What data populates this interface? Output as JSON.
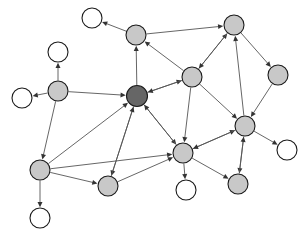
{
  "figure": {
    "type": "node-link-diagram",
    "background_color": "#ffffff",
    "width": 307,
    "height": 239
  },
  "style": {
    "hub_color": "#666666",
    "gray_color": "#c8c8c8",
    "white_color": "#ffffff",
    "node_stroke": "#1a1a1a",
    "edge_color": "#555555",
    "arrow_color": "#333333",
    "node_radius_gray": 10,
    "node_radius_white": 10,
    "node_radius_hub": 10.5
  },
  "chart_data": {
    "type": "scatter",
    "xlabel": "",
    "ylabel": "",
    "grid": false,
    "legend": "none",
    "xlim": [
      0,
      307
    ],
    "ylim": [
      0,
      239
    ],
    "node_count": 18,
    "edge_count": 33,
    "node_classes": [
      {
        "name": "hub",
        "color": "#666666",
        "count": 1
      },
      {
        "name": "intermediate",
        "color": "#c8c8c8",
        "count": 10
      },
      {
        "name": "leaf",
        "color": "#ffffff",
        "count": 7
      }
    ],
    "nodes": [
      {
        "id": "n0",
        "label": "",
        "x": 92,
        "y": 18,
        "r": 10,
        "class": "leaf",
        "color": "#ffffff"
      },
      {
        "id": "n1",
        "label": "",
        "x": 136,
        "y": 35,
        "r": 10,
        "class": "intermediate",
        "color": "#c8c8c8"
      },
      {
        "id": "n2",
        "label": "",
        "x": 234,
        "y": 25,
        "r": 10,
        "class": "intermediate",
        "color": "#c8c8c8"
      },
      {
        "id": "n3",
        "label": "",
        "x": 58,
        "y": 52,
        "r": 10,
        "class": "leaf",
        "color": "#ffffff"
      },
      {
        "id": "n4",
        "label": "",
        "x": 192,
        "y": 77,
        "r": 10,
        "class": "intermediate",
        "color": "#c8c8c8"
      },
      {
        "id": "n5",
        "label": "",
        "x": 278,
        "y": 75,
        "r": 10,
        "class": "intermediate",
        "color": "#c8c8c8"
      },
      {
        "id": "n6",
        "label": "",
        "x": 58,
        "y": 91,
        "r": 10,
        "class": "intermediate",
        "color": "#c8c8c8"
      },
      {
        "id": "n7",
        "label": "",
        "x": 137,
        "y": 96,
        "r": 10.5,
        "class": "hub",
        "color": "#666666"
      },
      {
        "id": "n8",
        "label": "",
        "x": 22,
        "y": 98,
        "r": 10,
        "class": "leaf",
        "color": "#ffffff"
      },
      {
        "id": "n9",
        "label": "",
        "x": 245,
        "y": 126,
        "r": 10,
        "class": "intermediate",
        "color": "#c8c8c8"
      },
      {
        "id": "n10",
        "label": "",
        "x": 183,
        "y": 153,
        "r": 10,
        "class": "intermediate",
        "color": "#c8c8c8"
      },
      {
        "id": "n11",
        "label": "",
        "x": 287,
        "y": 150,
        "r": 10,
        "class": "leaf",
        "color": "#ffffff"
      },
      {
        "id": "n12",
        "label": "",
        "x": 40,
        "y": 170,
        "r": 10,
        "class": "intermediate",
        "color": "#c8c8c8"
      },
      {
        "id": "n13",
        "label": "",
        "x": 238,
        "y": 184,
        "r": 10,
        "class": "intermediate",
        "color": "#c8c8c8"
      },
      {
        "id": "n14",
        "label": "",
        "x": 108,
        "y": 186,
        "r": 10,
        "class": "intermediate",
        "color": "#c8c8c8"
      },
      {
        "id": "n15",
        "label": "",
        "x": 186,
        "y": 190,
        "r": 10,
        "class": "leaf",
        "color": "#ffffff"
      },
      {
        "id": "n16",
        "label": "",
        "x": 40,
        "y": 218,
        "r": 10,
        "class": "leaf",
        "color": "#ffffff"
      },
      {
        "id": "n17",
        "label": "",
        "x": 234,
        "y": 25,
        "r": 0,
        "class": "hidden",
        "color": "#ffffff"
      }
    ],
    "edges": [
      {
        "from": "n1",
        "to": "n0",
        "directed": true
      },
      {
        "from": "n1",
        "to": "n2",
        "directed": true
      },
      {
        "from": "n7",
        "to": "n1",
        "directed": true
      },
      {
        "from": "n4",
        "to": "n1",
        "directed": true
      },
      {
        "from": "n4",
        "to": "n2",
        "directed": true
      },
      {
        "from": "n2",
        "to": "n5",
        "directed": true
      },
      {
        "from": "n9",
        "to": "n2",
        "directed": true
      },
      {
        "from": "n6",
        "to": "n3",
        "directed": true
      },
      {
        "from": "n6",
        "to": "n8",
        "directed": true
      },
      {
        "from": "n6",
        "to": "n7",
        "directed": true
      },
      {
        "from": "n6",
        "to": "n12",
        "directed": true
      },
      {
        "from": "n7",
        "to": "n4",
        "directed": true
      },
      {
        "from": "n4",
        "to": "n9",
        "directed": true
      },
      {
        "from": "n4",
        "to": "n10",
        "directed": true
      },
      {
        "from": "n5",
        "to": "n9",
        "directed": true
      },
      {
        "from": "n7",
        "to": "n10",
        "directed": true
      },
      {
        "from": "n7",
        "to": "n14",
        "directed": true
      },
      {
        "from": "n12",
        "to": "n7",
        "directed": true
      },
      {
        "from": "n14",
        "to": "n7",
        "directed": true
      },
      {
        "from": "n10",
        "to": "n7",
        "directed": true
      },
      {
        "from": "n9",
        "to": "n11",
        "directed": true
      },
      {
        "from": "n9",
        "to": "n13",
        "directed": true
      },
      {
        "from": "n10",
        "to": "n9",
        "directed": true
      },
      {
        "from": "n10",
        "to": "n13",
        "directed": true
      },
      {
        "from": "n10",
        "to": "n15",
        "directed": true
      },
      {
        "from": "n14",
        "to": "n10",
        "directed": true
      },
      {
        "from": "n12",
        "to": "n16",
        "directed": true
      },
      {
        "from": "n12",
        "to": "n14",
        "directed": true
      },
      {
        "from": "n13",
        "to": "n9",
        "directed": true
      },
      {
        "from": "n9",
        "to": "n10",
        "directed": true
      },
      {
        "from": "n4",
        "to": "n7",
        "directed": true
      },
      {
        "from": "n2",
        "to": "n4",
        "directed": true
      },
      {
        "from": "n12",
        "to": "n10",
        "directed": true
      }
    ]
  }
}
